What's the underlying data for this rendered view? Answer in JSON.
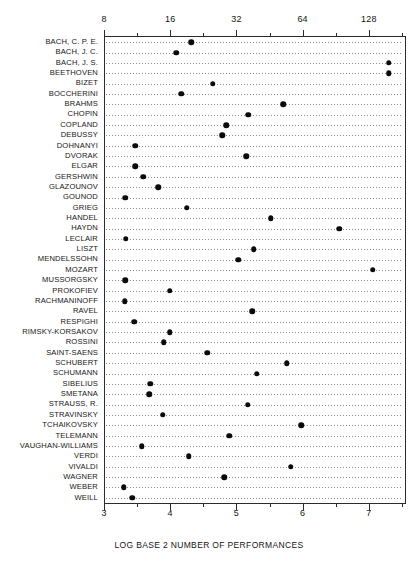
{
  "chart_data": {
    "type": "scatter",
    "title": "",
    "xlabel": "LOG BASE 2 NUMBER OF PERFORMANCES",
    "ylabel": "",
    "xlim": [
      3.0,
      7.55
    ],
    "grid": true,
    "legend": null,
    "orientation": "horizontal-dot-plot",
    "axis_top": {
      "label": "number of performances",
      "scale": "log2",
      "tick_labels": [
        "8",
        "16",
        "32",
        "64",
        "128"
      ],
      "tick_values": [
        3,
        4,
        5,
        6,
        7
      ]
    },
    "axis_bottom": {
      "label": "LOG BASE 2 NUMBER OF PERFORMANCES",
      "scale": "linear",
      "tick_labels": [
        "3",
        "4",
        "5",
        "6",
        "7"
      ],
      "tick_values": [
        3,
        4,
        5,
        6,
        7
      ]
    },
    "minor_ticks": [
      3.5,
      4.5,
      5.5,
      6.5,
      7.5
    ],
    "categories": [
      "BACH, C. P. E.",
      "BACH, J. C.",
      "BACH, J. S.",
      "BEETHOVEN",
      "BIZET",
      "BOCCHERINI",
      "BRAHMS",
      "CHOPIN",
      "COPLAND",
      "DEBUSSY",
      "DOHNANYI",
      "DVORAK",
      "ELGAR",
      "GERSHWIN",
      "GLAZOUNOV",
      "GOUNOD",
      "GRIEG",
      "HANDEL",
      "HAYDN",
      "LECLAIR",
      "LISZT",
      "MENDELSSOHN",
      "MOZART",
      "MUSSORGSKY",
      "PROKOFIEV",
      "RACHMANINOFF",
      "RAVEL",
      "RESPIGHI",
      "RIMSKY-KORSAKOV",
      "ROSSINI",
      "SAINT-SAENS",
      "SCHUBERT",
      "SCHUMANN",
      "SIBELIUS",
      "SMETANA",
      "STRAUSS, R.",
      "STRAVINSKY",
      "TCHAIKOVSKY",
      "TELEMANN",
      "VAUGHAN-WILLIAMS",
      "VERDI",
      "VIVALDI",
      "WAGNER",
      "WEBER",
      "WEILL"
    ],
    "values": [
      4.32,
      4.09,
      7.3,
      7.3,
      4.64,
      4.17,
      5.71,
      5.18,
      4.85,
      4.79,
      3.47,
      5.15,
      3.47,
      3.59,
      3.82,
      3.32,
      4.25,
      5.52,
      6.55,
      3.33,
      5.26,
      5.03,
      7.06,
      3.32,
      3.99,
      3.31,
      5.24,
      3.46,
      3.99,
      3.9,
      4.56,
      5.76,
      5.31,
      3.7,
      3.68,
      5.17,
      3.89,
      5.98,
      4.89,
      3.57,
      4.28,
      5.82,
      4.82,
      3.3,
      3.43
    ],
    "marker": {
      "shape": "circle",
      "color": "#0a0a0a",
      "size": 5.5
    },
    "gridline_color": "#8d8d8d",
    "axis_color": "#2b2b2b"
  }
}
